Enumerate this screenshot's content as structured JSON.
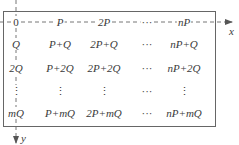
{
  "diagram": {
    "type": "grid-of-lattice-points",
    "axes": {
      "x_label": "x",
      "y_label": "y",
      "origin_label": "0"
    },
    "columns": [
      "0 column",
      "P column",
      "2P column",
      "ellipsis column",
      "nP column"
    ],
    "rows": [
      [
        "0",
        "P",
        "2P",
        "···",
        "nP"
      ],
      [
        "Q",
        "P+Q",
        "2P+Q",
        "···",
        "nP+Q"
      ],
      [
        "2Q",
        "P+2Q",
        "2P+2Q",
        "···",
        "nP+2Q"
      ],
      [
        "⋮",
        "⋮",
        "⋮",
        "···",
        "⋮"
      ],
      [
        "mQ",
        "P+mQ",
        "2P+mQ",
        "···",
        "nP+mQ"
      ]
    ],
    "colors": {
      "line": "#555555",
      "text": "#3a3a3a",
      "background": "#ffffff"
    }
  }
}
